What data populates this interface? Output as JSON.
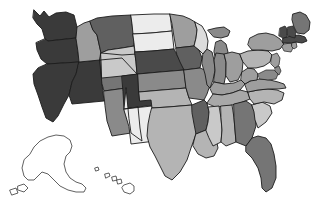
{
  "figure": {
    "title": "",
    "subtitle": "",
    "background_color": "#ffffff",
    "border_color": "#1c1c1c",
    "no_data_color": "#ffffff"
  },
  "chart_data": {
    "type": "heatmap",
    "subtype": "choropleth-map",
    "title": "",
    "xlabel": "",
    "ylabel": "",
    "grid": false,
    "legend": "none",
    "projection": "albers-usa",
    "value_scale": "grayscale",
    "scale_note": "darker shade = higher value",
    "palette": [
      "#ececec",
      "#dcdcdc",
      "#c9c9c9",
      "#b4b4b4",
      "#9e9e9e",
      "#8a8a8a",
      "#757575",
      "#606060",
      "#4a4a4a",
      "#3a3a3a"
    ],
    "categories": [
      "AL",
      "AK",
      "AZ",
      "AR",
      "CA",
      "CO",
      "CT",
      "DE",
      "FL",
      "GA",
      "HI",
      "ID",
      "IL",
      "IN",
      "IA",
      "KS",
      "KY",
      "LA",
      "ME",
      "MD",
      "MA",
      "MI",
      "MN",
      "MS",
      "MO",
      "MT",
      "NE",
      "NV",
      "NH",
      "NJ",
      "NM",
      "NY",
      "NC",
      "ND",
      "OH",
      "OK",
      "OR",
      "PA",
      "RI",
      "SC",
      "SD",
      "TN",
      "TX",
      "UT",
      "VT",
      "VA",
      "WA",
      "WV",
      "WI",
      "WY"
    ],
    "series": [
      {
        "name": "state value",
        "values": [
          3,
          0,
          5,
          8,
          9,
          9,
          6,
          5,
          7,
          7,
          0,
          6,
          5,
          5,
          8,
          5,
          4,
          4,
          6,
          5,
          9,
          6,
          6,
          3,
          5,
          8,
          8,
          9,
          9,
          5,
          1,
          5,
          3,
          1,
          5,
          4,
          9,
          3,
          6,
          3,
          1,
          4,
          4,
          7,
          8,
          5,
          9,
          4,
          1,
          3
        ]
      }
    ],
    "state_fills": {
      "AL": "#b4b4b4",
      "AK": "#ffffff",
      "AZ": "#8a8a8a",
      "AR": "#606060",
      "CA": "#3a3a3a",
      "CO": "#3a3a3a",
      "CT": "#9e9e9e",
      "DE": "#8a8a8a",
      "FL": "#757575",
      "GA": "#757575",
      "HI": "#ffffff",
      "ID": "#9e9e9e",
      "IL": "#8a8a8a",
      "IN": "#8a8a8a",
      "IA": "#606060",
      "KS": "#8a8a8a",
      "KY": "#9e9e9e",
      "LA": "#b4b4b4",
      "ME": "#757575",
      "MD": "#8a8a8a",
      "MA": "#4a4a4a",
      "MI": "#8a8a8a",
      "MN": "#9e9e9e",
      "MS": "#c9c9c9",
      "MO": "#8a8a8a",
      "MT": "#606060",
      "NE": "#4a4a4a",
      "NV": "#3a3a3a",
      "NH": "#4a4a4a",
      "NJ": "#9e9e9e",
      "NM": "#ececec",
      "NY": "#9e9e9e",
      "NC": "#b4b4b4",
      "ND": "#ececec",
      "OH": "#9e9e9e",
      "OK": "#b4b4b4",
      "OR": "#3a3a3a",
      "PA": "#b4b4b4",
      "RI": "#9e9e9e",
      "SC": "#c9c9c9",
      "SD": "#ececec",
      "TN": "#a8a8a8",
      "TX": "#b4b4b4",
      "UT": "#757575",
      "VT": "#4a4a4a",
      "VA": "#9e9e9e",
      "WA": "#3a3a3a",
      "WV": "#9e9e9e",
      "WI": "#dcdcdc",
      "WY": "#c9c9c9"
    },
    "state_names": {
      "AL": "Alabama",
      "AK": "Alaska",
      "AZ": "Arizona",
      "AR": "Arkansas",
      "CA": "California",
      "CO": "Colorado",
      "CT": "Connecticut",
      "DE": "Delaware",
      "FL": "Florida",
      "GA": "Georgia",
      "HI": "Hawaii",
      "ID": "Idaho",
      "IL": "Illinois",
      "IN": "Indiana",
      "IA": "Iowa",
      "KS": "Kansas",
      "KY": "Kentucky",
      "LA": "Louisiana",
      "ME": "Maine",
      "MD": "Maryland",
      "MA": "Massachusetts",
      "MI": "Michigan",
      "MN": "Minnesota",
      "MS": "Mississippi",
      "MO": "Missouri",
      "MT": "Montana",
      "NE": "Nebraska",
      "NV": "Nevada",
      "NH": "New Hampshire",
      "NJ": "New Jersey",
      "NM": "New Mexico",
      "NY": "New York",
      "NC": "North Carolina",
      "ND": "North Dakota",
      "OH": "Ohio",
      "OK": "Oklahoma",
      "OR": "Oregon",
      "PA": "Pennsylvania",
      "RI": "Rhode Island",
      "SC": "South Carolina",
      "SD": "South Dakota",
      "TN": "Tennessee",
      "TX": "Texas",
      "UT": "Utah",
      "VT": "Vermont",
      "VA": "Virginia",
      "WA": "Washington",
      "WV": "West Virginia",
      "WI": "Wisconsin",
      "WY": "Wyoming"
    }
  }
}
